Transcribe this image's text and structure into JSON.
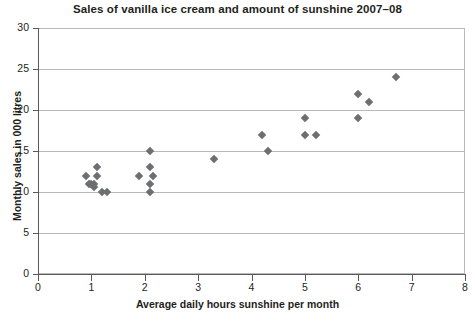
{
  "chart_data": {
    "type": "scatter",
    "title": "Sales of vanilla ice cream and amount of sunshine 2007–08",
    "xlabel": "Average daily hours sunshine per month",
    "ylabel": "Monthly sales in 000 litres",
    "xlim": [
      0,
      8
    ],
    "ylim": [
      0,
      30
    ],
    "xticks": [
      "0",
      "1",
      "2",
      "3",
      "4",
      "5",
      "6",
      "7",
      "8"
    ],
    "yticks": [
      "0",
      "5",
      "10",
      "15",
      "20",
      "25",
      "30"
    ],
    "xtick_values": [
      0,
      1,
      2,
      3,
      4,
      5,
      6,
      7,
      8
    ],
    "ytick_values": [
      0,
      5,
      10,
      15,
      20,
      25,
      30
    ],
    "grid": "horizontal",
    "legend": "none",
    "marker": "diamond",
    "marker_color": "#6d6e71",
    "points": [
      {
        "x": 0.9,
        "y": 12
      },
      {
        "x": 0.95,
        "y": 11
      },
      {
        "x": 1.05,
        "y": 11
      },
      {
        "x": 1.1,
        "y": 13
      },
      {
        "x": 1.1,
        "y": 12
      },
      {
        "x": 1.0,
        "y": 11
      },
      {
        "x": 1.05,
        "y": 10.6
      },
      {
        "x": 1.2,
        "y": 10
      },
      {
        "x": 1.3,
        "y": 10
      },
      {
        "x": 1.9,
        "y": 12
      },
      {
        "x": 2.1,
        "y": 15
      },
      {
        "x": 2.1,
        "y": 13
      },
      {
        "x": 2.15,
        "y": 12
      },
      {
        "x": 2.1,
        "y": 11
      },
      {
        "x": 2.1,
        "y": 10
      },
      {
        "x": 3.3,
        "y": 14
      },
      {
        "x": 4.2,
        "y": 17
      },
      {
        "x": 4.3,
        "y": 15
      },
      {
        "x": 5.0,
        "y": 19
      },
      {
        "x": 5.0,
        "y": 17
      },
      {
        "x": 5.2,
        "y": 17
      },
      {
        "x": 6.0,
        "y": 22
      },
      {
        "x": 6.0,
        "y": 19
      },
      {
        "x": 6.2,
        "y": 21
      },
      {
        "x": 6.7,
        "y": 24
      }
    ]
  },
  "colors": {
    "marker": "#6d6e71",
    "grid": "#b9b9b9",
    "axis": "#58595b",
    "text": "#231f20",
    "background": "#ffffff"
  }
}
